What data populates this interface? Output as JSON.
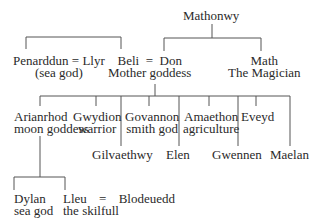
{
  "diagram": {
    "type": "family-tree",
    "title_clipped": true,
    "nodes": {
      "mathonwy": {
        "name": "Mathonwy"
      },
      "penarddun_llyr": {
        "line1": "Penarddun = Llyr",
        "line2": "(sea god)"
      },
      "beli_don": {
        "line1": "Beli  =  Don",
        "line2": "Mother goddess"
      },
      "math": {
        "line1": "Math",
        "line2": "The Magician"
      },
      "arianrhod": {
        "line1": "Arianrhod",
        "line2": "moon goddess"
      },
      "gwydion": {
        "line1": "Gwydion",
        "line2": "warrior"
      },
      "gilvaethwy": {
        "name": "Gilvaethwy"
      },
      "govannon": {
        "line1": "Govannon",
        "line2": "smith god"
      },
      "elen": {
        "name": "Elen"
      },
      "amaethon": {
        "line1": "Amaethon",
        "line2": "agriculture"
      },
      "gwennen": {
        "name": "Gwennen"
      },
      "eveyd": {
        "name": "Eveyd"
      },
      "maelan": {
        "name": "Maelan"
      },
      "dylan": {
        "line1": "Dylan",
        "line2": "sea god"
      },
      "lleu_blodeuedd": {
        "line1a": "Lleu",
        "eq": "=",
        "line1b": "Blodeuedd",
        "line2": "the skilfull"
      }
    },
    "relations": [
      {
        "parent": "Mathonwy",
        "children": [
          "Don",
          "Math"
        ]
      },
      {
        "link": [
          "Llyr",
          "Beli"
        ]
      },
      {
        "parents": "Beli = Don",
        "children": [
          "Arianrhod",
          "Gwydion",
          "Gilvaethwy",
          "Govannon",
          "Elen",
          "Amaethon",
          "Gwennen",
          "Eveyd",
          "Maelan"
        ]
      },
      {
        "parent": "Arianrhod",
        "children": [
          "Dylan",
          "Lleu"
        ]
      },
      {
        "spouses": [
          "Lleu",
          "Blodeuedd"
        ]
      }
    ]
  }
}
